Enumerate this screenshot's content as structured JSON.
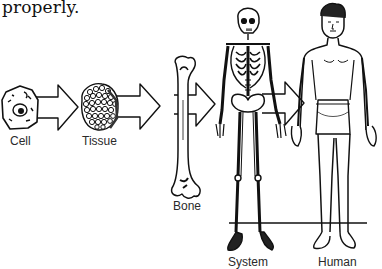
{
  "caption": {
    "text": "properly."
  },
  "stages": [
    {
      "id": "cell",
      "label": "Cell"
    },
    {
      "id": "tissue",
      "label": "Tissue"
    },
    {
      "id": "bone",
      "label": "Bone"
    },
    {
      "id": "system",
      "label": "System"
    },
    {
      "id": "human",
      "label": "Human"
    }
  ],
  "arrows": [
    {
      "from": "cell",
      "to": "tissue"
    },
    {
      "from": "tissue",
      "to": "bone"
    },
    {
      "from": "bone",
      "to": "system"
    },
    {
      "from": "system",
      "to": "human"
    }
  ],
  "colors": {
    "ink": "#111111",
    "background": "#ffffff",
    "label": "#2a2a2a"
  }
}
